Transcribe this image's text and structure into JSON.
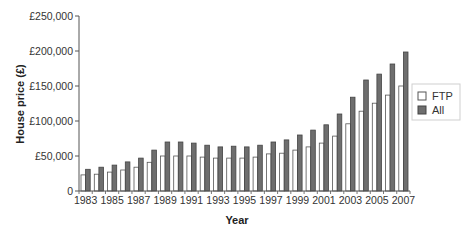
{
  "chart_data": {
    "type": "bar",
    "title": "",
    "xlabel": "Year",
    "ylabel": "House price (£)",
    "ylim": [
      0,
      250000
    ],
    "yticks": [
      0,
      50000,
      100000,
      150000,
      200000,
      250000
    ],
    "ytick_labels": [
      "0",
      "£50,000",
      "£100,000",
      "£150,000",
      "£200,000",
      "£250,000"
    ],
    "categories": [
      "1983",
      "1984",
      "1985",
      "1986",
      "1987",
      "1988",
      "1989",
      "1990",
      "1991",
      "1992",
      "1993",
      "1994",
      "1995",
      "1996",
      "1997",
      "1998",
      "1999",
      "2000",
      "2001",
      "2002",
      "2003",
      "2004",
      "2005",
      "2006",
      "2007"
    ],
    "xtick_labels": [
      "1983",
      "1985",
      "1987",
      "1989",
      "1991",
      "1993",
      "1995",
      "1997",
      "1999",
      "2001",
      "2003",
      "2005",
      "2007"
    ],
    "series": [
      {
        "name": "FTP",
        "color": "#ffffff",
        "stroke": "#555555",
        "values": [
          23000,
          24000,
          27000,
          30000,
          34000,
          41000,
          50000,
          50000,
          50000,
          48500,
          47000,
          47000,
          47000,
          48500,
          53000,
          54000,
          58500,
          63000,
          68500,
          78500,
          96000,
          114000,
          125500,
          137000,
          150000
        ]
      },
      {
        "name": "All",
        "color": "#6e6e6e",
        "stroke": "#444444",
        "values": [
          31000,
          34000,
          37000,
          41500,
          47000,
          58500,
          70000,
          70000,
          68500,
          65500,
          63000,
          64000,
          63000,
          65500,
          70000,
          73000,
          80000,
          87000,
          94500,
          110000,
          134000,
          158500,
          167000,
          181500,
          198500
        ]
      }
    ],
    "legend": {
      "position": "right",
      "entries": [
        "FTP",
        "All"
      ]
    },
    "grid": false
  }
}
